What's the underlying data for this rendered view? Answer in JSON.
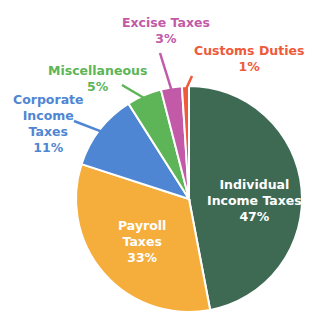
{
  "chart_data": {
    "type": "pie",
    "title": "",
    "start_angle": "12 o'clock",
    "direction": "clockwise",
    "slices": [
      {
        "label": "Individual Income Taxes",
        "lines": [
          "Individual",
          "Income Taxes"
        ],
        "value": 47,
        "pct_label": "47%",
        "color": "#3e6a54",
        "label_color": "#ffffff",
        "label_position": "inside"
      },
      {
        "label": "Payroll Taxes",
        "lines": [
          "Payroll",
          "Taxes"
        ],
        "value": 33,
        "pct_label": "33%",
        "color": "#f5ad3c",
        "label_color": "#ffffff",
        "label_position": "inside"
      },
      {
        "label": "Corporate Income Taxes",
        "lines": [
          "Corporate",
          "Income",
          "Taxes"
        ],
        "value": 11,
        "pct_label": "11%",
        "color": "#4f86d3",
        "label_color": "#4f86d3",
        "label_position": "outside"
      },
      {
        "label": "Miscellaneous",
        "lines": [
          "Miscellaneous"
        ],
        "value": 5,
        "pct_label": "5%",
        "color": "#5db558",
        "label_color": "#5db558",
        "label_position": "outside"
      },
      {
        "label": "Excise Taxes",
        "lines": [
          "Excise Taxes"
        ],
        "value": 3,
        "pct_label": "3%",
        "color": "#c25aa8",
        "label_color": "#c25aa8",
        "label_position": "outside"
      },
      {
        "label": "Customs Duties",
        "lines": [
          "Customs Duties"
        ],
        "value": 1,
        "pct_label": "1%",
        "color": "#ee5a3a",
        "label_color": "#ee5a3a",
        "label_position": "outside"
      }
    ],
    "legend": "none"
  }
}
